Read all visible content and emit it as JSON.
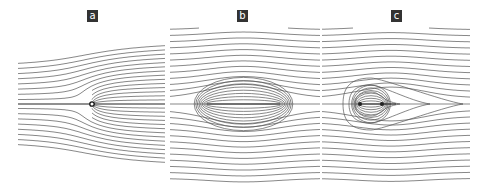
{
  "figure": {
    "background": "#ffffff",
    "line_color": "#555555",
    "label_bg": "#333333",
    "label_fg": "#ffffff"
  },
  "panels": [
    {
      "id": "a",
      "label": "a",
      "left": 16,
      "width": 152,
      "label_x": 87,
      "center_y": 104,
      "type": "point-source",
      "source_x": 92
    },
    {
      "id": "b",
      "label": "b",
      "left": 168,
      "width": 152,
      "label_x": 237,
      "center_y": 104,
      "type": "segment",
      "seg_x0": 207,
      "seg_x1": 280
    },
    {
      "id": "c",
      "label": "c",
      "left": 322,
      "width": 152,
      "label_x": 391,
      "center_y": 104,
      "type": "dipole-wake",
      "seg_x0": 360,
      "seg_x1": 382,
      "wake_end": 463
    }
  ]
}
